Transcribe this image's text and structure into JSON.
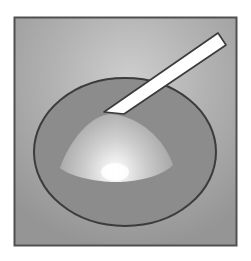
{
  "figure": {
    "colors": {
      "page_background": "#ffffff",
      "panel_border": "#505050",
      "panel_light": "#c8c8c8",
      "panel_dark": "#989898",
      "dish_fill": "#8c8c8c",
      "dish_stroke": "#3c3c3c",
      "cone_light": "#ffffff",
      "cone_mid": "#d6d6d6",
      "cone_edge": "#a8a8a8",
      "probe_fill": "#ffffff",
      "probe_stroke": "#3a3a3a"
    },
    "elements": {
      "panel": {
        "label": "background panel",
        "x": 14,
        "y": 17,
        "width": 223,
        "height": 229
      },
      "dish": {
        "label": "elliptical dish",
        "cx": 125,
        "cy": 152,
        "rx": 91,
        "ry": 74
      },
      "cone": {
        "label": "cone of light",
        "apex": [
          110,
          114
        ],
        "base_left": [
          60,
          168
        ],
        "base_right": [
          172,
          165
        ],
        "bottom": 182
      },
      "hotspot": {
        "label": "bright spot",
        "cx": 115,
        "cy": 172
      },
      "probe": {
        "label": "white rod / probe",
        "tip": [
          115,
          113
        ],
        "end": [
          222,
          39
        ]
      }
    }
  }
}
